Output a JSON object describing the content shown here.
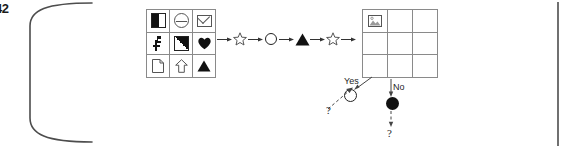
{
  "figure": {
    "number": "42",
    "caption_visible": false
  },
  "frame": {
    "style": "rounded-page-border",
    "color": "#555555"
  },
  "source_grid": {
    "name": "symbol-matrix",
    "rows": 3,
    "columns": 3,
    "cells": [
      {
        "row": 1,
        "col": 1,
        "icon": "half-filled-square-icon",
        "label": "square half black"
      },
      {
        "row": 1,
        "col": 2,
        "icon": "barred-circle-icon",
        "label": "circle with bar"
      },
      {
        "row": 1,
        "col": 3,
        "icon": "envelope-icon",
        "label": "envelope"
      },
      {
        "row": 2,
        "col": 1,
        "icon": "key-mark-icon",
        "label": "key mark"
      },
      {
        "row": 2,
        "col": 2,
        "icon": "diagonal-half-square-icon",
        "label": "square diagonal black"
      },
      {
        "row": 2,
        "col": 3,
        "icon": "heart-icon",
        "label": "filled heart"
      },
      {
        "row": 3,
        "col": 1,
        "icon": "document-icon",
        "label": "document folded corner"
      },
      {
        "row": 3,
        "col": 2,
        "icon": "up-arrow-outline-icon",
        "label": "outlined up arrow"
      },
      {
        "row": 3,
        "col": 3,
        "icon": "filled-triangle-icon",
        "label": "filled triangle"
      }
    ]
  },
  "sequence": {
    "name": "transformation-sequence",
    "steps": [
      {
        "type": "arrow",
        "icon": "right-arrow-icon"
      },
      {
        "type": "symbol",
        "icon": "star-outline-icon",
        "label": "star"
      },
      {
        "type": "arrow",
        "icon": "right-arrow-icon"
      },
      {
        "type": "symbol",
        "icon": "circle-outline-icon",
        "label": "circle"
      },
      {
        "type": "arrow",
        "icon": "right-arrow-icon"
      },
      {
        "type": "symbol",
        "icon": "filled-triangle-icon",
        "label": "triangle"
      },
      {
        "type": "arrow",
        "icon": "right-arrow-icon"
      },
      {
        "type": "symbol",
        "icon": "star-outline-icon",
        "label": "star"
      },
      {
        "type": "arrow",
        "icon": "right-arrow-icon"
      }
    ]
  },
  "target_grid": {
    "name": "result-matrix",
    "rows": 3,
    "columns": 3,
    "cells": [
      {
        "row": 1,
        "col": 1,
        "icon": "picture-icon",
        "label": "picture"
      },
      {
        "row": 1,
        "col": 2,
        "icon": "",
        "label": ""
      },
      {
        "row": 1,
        "col": 3,
        "icon": "",
        "label": ""
      },
      {
        "row": 2,
        "col": 1,
        "icon": "",
        "label": ""
      },
      {
        "row": 2,
        "col": 2,
        "icon": "",
        "label": ""
      },
      {
        "row": 2,
        "col": 3,
        "icon": "",
        "label": ""
      },
      {
        "row": 3,
        "col": 1,
        "icon": "",
        "label": ""
      },
      {
        "row": 3,
        "col": 2,
        "icon": "",
        "label": ""
      },
      {
        "row": 3,
        "col": 3,
        "icon": "",
        "label": ""
      }
    ]
  },
  "decision": {
    "name": "yes-no-branch",
    "yes": {
      "label": "Yes",
      "node_icon": "open-circle-icon",
      "node_fill": "#ffffff",
      "incoming_label": "?"
    },
    "no": {
      "label": "No",
      "node_icon": "filled-circle-icon",
      "node_fill": "#111111",
      "outgoing_label": "?"
    }
  }
}
